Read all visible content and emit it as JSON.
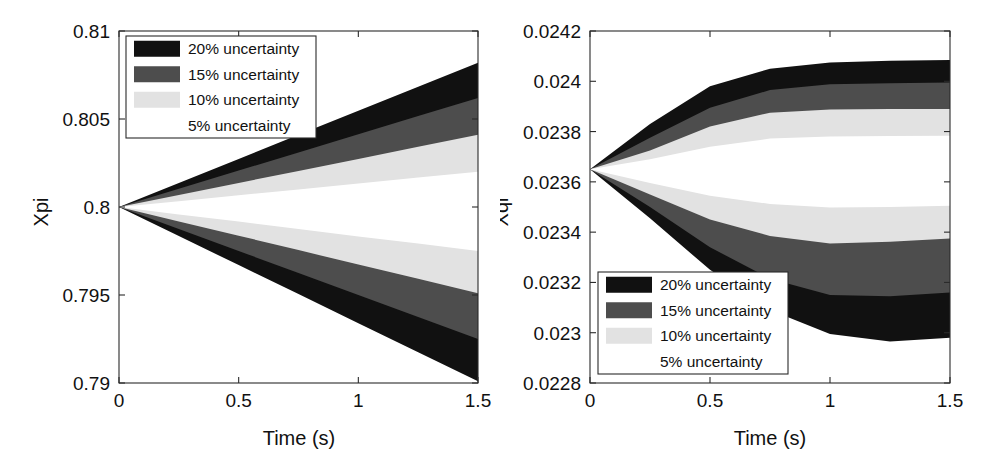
{
  "figure": {
    "background": "#ffffff",
    "panel_count": 2
  },
  "legend_entries": [
    {
      "label": "20% uncertainty",
      "color": "#111111",
      "percent": 20
    },
    {
      "label": "15% uncertainty",
      "color": "#4d4d4d",
      "percent": 15
    },
    {
      "label": "10% uncertainty",
      "color": "#e2e2e2",
      "percent": 10
    },
    {
      "label": "5% uncertainty",
      "color": "#ffffff",
      "percent": 5
    }
  ],
  "panels": {
    "left": {
      "name": "Xpi",
      "ylabel": "Xpi",
      "xlabel": "Time (s)",
      "xticks": [
        "0",
        "0.5",
        "1",
        "1.5"
      ],
      "yticks": [
        "0.79",
        "0.795",
        "0.8",
        "0.805",
        "0.81"
      ],
      "legend_position": "top-left"
    },
    "right": {
      "name": "Xqi",
      "ylabel": "Xqi",
      "xlabel": "Time (s)",
      "xticks": [
        "0",
        "0.5",
        "1",
        "1.5"
      ],
      "yticks": [
        "0.0228",
        "0.023",
        "0.0232",
        "0.0234",
        "0.0236",
        "0.0238",
        "0.024",
        "0.0242"
      ],
      "legend_position": "bottom-left"
    }
  },
  "chart_data": [
    {
      "type": "area",
      "id": "xpi-uncertainty-bands",
      "title": "",
      "xlabel": "Time (s)",
      "ylabel": "Xpi",
      "xlim": [
        0,
        1.5
      ],
      "ylim": [
        0.79,
        0.81
      ],
      "xticks": [
        0,
        0.5,
        1,
        1.5
      ],
      "yticks": [
        0.79,
        0.795,
        0.8,
        0.805,
        0.81
      ],
      "grid": false,
      "legend_position": "upper left",
      "nominal_start": 0.8,
      "description": "Four nested uncertainty envelopes diverging linearly from the nominal value 0.8 at t=0.",
      "x": [
        0,
        0.25,
        0.5,
        0.75,
        1.0,
        1.25,
        1.5
      ],
      "series": [
        {
          "name": "20% uncertainty",
          "color": "#111111",
          "upper": [
            0.8,
            0.80137,
            0.80273,
            0.8041,
            0.80547,
            0.80683,
            0.8082
          ],
          "lower": [
            0.8,
            0.79835,
            0.7967,
            0.79505,
            0.7934,
            0.79175,
            0.7901
          ]
        },
        {
          "name": "15% uncertainty",
          "color": "#4d4d4d",
          "upper": [
            0.8,
            0.80103,
            0.80207,
            0.8031,
            0.80413,
            0.80517,
            0.8062
          ],
          "lower": [
            0.8,
            0.79875,
            0.7975,
            0.79625,
            0.795,
            0.79375,
            0.7925
          ]
        },
        {
          "name": "10% uncertainty",
          "color": "#e2e2e2",
          "upper": [
            0.8,
            0.80068,
            0.80137,
            0.80205,
            0.80273,
            0.80342,
            0.8041
          ],
          "lower": [
            0.8,
            0.79918,
            0.79837,
            0.79755,
            0.79673,
            0.79592,
            0.7951
          ]
        },
        {
          "name": "5% uncertainty",
          "color": "#ffffff",
          "upper": [
            0.8,
            0.80033,
            0.80067,
            0.801,
            0.80133,
            0.80167,
            0.802
          ],
          "lower": [
            0.8,
            0.79958,
            0.79917,
            0.79875,
            0.79833,
            0.79792,
            0.7975
          ]
        }
      ]
    },
    {
      "type": "area",
      "id": "xqi-uncertainty-bands",
      "title": "",
      "xlabel": "Time (s)",
      "ylabel": "Xqi",
      "xlim": [
        0,
        1.5
      ],
      "ylim": [
        0.0228,
        0.0242
      ],
      "xticks": [
        0,
        0.5,
        1,
        1.5
      ],
      "yticks": [
        0.0228,
        0.023,
        0.0232,
        0.0234,
        0.0236,
        0.0238,
        0.024,
        0.0242
      ],
      "grid": false,
      "legend_position": "lower left",
      "nominal_start": 0.02365,
      "description": "Four nested uncertainty envelopes diverging from the nominal value 0.02365 at t=0, widening with a saturating (S-shaped) profile toward t=1.5; the lower envelope spreads slightly more than the upper.",
      "x": [
        0,
        0.25,
        0.5,
        0.75,
        1.0,
        1.25,
        1.5
      ],
      "series": [
        {
          "name": "20% uncertainty",
          "color": "#111111",
          "upper": [
            0.02365,
            0.02383,
            0.02398,
            0.02405,
            0.024075,
            0.024082,
            0.024085
          ],
          "lower": [
            0.02365,
            0.023455,
            0.02325,
            0.02309,
            0.022995,
            0.022965,
            0.02298
          ]
        },
        {
          "name": "15% uncertainty",
          "color": "#4d4d4d",
          "upper": [
            0.02365,
            0.023775,
            0.023895,
            0.023965,
            0.023988,
            0.023992,
            0.023995
          ],
          "lower": [
            0.02365,
            0.0235,
            0.02334,
            0.023215,
            0.02315,
            0.023145,
            0.02316
          ]
        },
        {
          "name": "10% uncertainty",
          "color": "#e2e2e2",
          "upper": [
            0.02365,
            0.023725,
            0.02382,
            0.023875,
            0.023888,
            0.02389,
            0.02389
          ],
          "lower": [
            0.02365,
            0.02355,
            0.02345,
            0.023385,
            0.023355,
            0.023362,
            0.023375
          ]
        },
        {
          "name": "5% uncertainty",
          "color": "#ffffff",
          "upper": [
            0.02365,
            0.02369,
            0.02374,
            0.023772,
            0.02378,
            0.023782,
            0.023783
          ],
          "lower": [
            0.02365,
            0.023595,
            0.023545,
            0.023512,
            0.023498,
            0.0235,
            0.023505
          ]
        }
      ]
    }
  ]
}
